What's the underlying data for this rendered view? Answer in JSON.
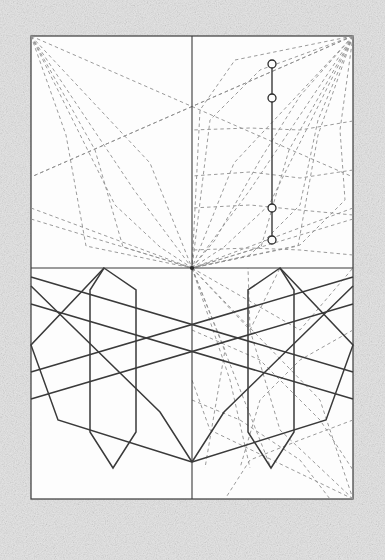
{
  "document": {
    "title": "Geometric construction plate",
    "background_color": "#e2e2e2",
    "paper_color": "#fdfdfd",
    "ink_color": "#3a3a3a",
    "dashed_color": "#8a8a8a",
    "frame": {
      "x": 31,
      "y": 36,
      "width": 322,
      "height": 463
    }
  },
  "chart_data": {
    "type": "diagram",
    "axes": {
      "vertical_axis": {
        "x": 192,
        "y1": 36,
        "y2": 499
      },
      "horizontal_axis": {
        "y": 268,
        "x1": 31,
        "x2": 353
      },
      "center_point": {
        "x": 192,
        "y": 268
      }
    },
    "node_line": {
      "x": 272,
      "y_top": 64,
      "y_bottom": 240,
      "nodes": [
        {
          "cx": 272,
          "cy": 64,
          "r": 4
        },
        {
          "cx": 272,
          "cy": 98,
          "r": 4
        },
        {
          "cx": 272,
          "cy": 208,
          "r": 4
        },
        {
          "cx": 272,
          "cy": 240,
          "r": 4
        }
      ]
    },
    "upper_left_fan": {
      "origin": [
        31,
        36
      ],
      "target": [
        192,
        268
      ],
      "polylines": [
        [
          [
            31,
            36
          ],
          [
            353,
            177
          ]
        ],
        [
          [
            31,
            36
          ],
          [
            150,
            163
          ],
          [
            192,
            268
          ]
        ],
        [
          [
            31,
            36
          ],
          [
            134,
            190
          ],
          [
            192,
            268
          ]
        ],
        [
          [
            31,
            36
          ],
          [
            115,
            205
          ],
          [
            160,
            247
          ],
          [
            192,
            268
          ]
        ],
        [
          [
            31,
            36
          ],
          [
            95,
            150
          ],
          [
            123,
            247
          ],
          [
            192,
            268
          ]
        ],
        [
          [
            31,
            36
          ],
          [
            66,
            135
          ],
          [
            86,
            246
          ],
          [
            192,
            268
          ]
        ],
        [
          [
            31,
            219
          ],
          [
            192,
            268
          ]
        ],
        [
          [
            31,
            208
          ],
          [
            192,
            268
          ]
        ]
      ]
    },
    "upper_right_fan": {
      "origin": [
        353,
        36
      ],
      "target": [
        192,
        268
      ],
      "polylines": [
        [
          [
            353,
            36
          ],
          [
            31,
            177
          ]
        ],
        [
          [
            353,
            36
          ],
          [
            300,
            96
          ],
          [
            260,
            160
          ],
          [
            215,
            240
          ],
          [
            192,
            268
          ]
        ],
        [
          [
            353,
            36
          ],
          [
            318,
            120
          ],
          [
            300,
            205
          ],
          [
            250,
            255
          ],
          [
            192,
            268
          ]
        ],
        [
          [
            353,
            36
          ],
          [
            340,
            130
          ],
          [
            345,
            200
          ],
          [
            300,
            245
          ],
          [
            192,
            268
          ]
        ],
        [
          [
            353,
            36
          ],
          [
            260,
            70
          ],
          [
            210,
            120
          ],
          [
            192,
            268
          ]
        ],
        [
          [
            353,
            36
          ],
          [
            235,
            60
          ],
          [
            200,
            110
          ],
          [
            192,
            268
          ]
        ],
        [
          [
            353,
            121
          ],
          [
            300,
            130
          ],
          [
            250,
            128
          ],
          [
            192,
            130
          ]
        ],
        [
          [
            353,
            170
          ],
          [
            300,
            178
          ],
          [
            250,
            172
          ],
          [
            192,
            176
          ]
        ],
        [
          [
            353,
            215
          ],
          [
            300,
            210
          ],
          [
            250,
            205
          ],
          [
            192,
            208
          ]
        ],
        [
          [
            353,
            255
          ],
          [
            300,
            250
          ],
          [
            250,
            248
          ],
          [
            192,
            250
          ]
        ]
      ]
    },
    "lower_left_figure": {
      "mirror_axis_x": 192,
      "polygon": [
        [
          104,
          268
        ],
        [
          136,
          290
        ],
        [
          136,
          432
        ],
        [
          113,
          468
        ],
        [
          90,
          432
        ],
        [
          90,
          290
        ]
      ],
      "diagonals": [
        [
          [
            31,
            304
          ],
          [
            353,
            399
          ]
        ],
        [
          [
            31,
            372
          ],
          [
            353,
            277
          ]
        ],
        [
          [
            31,
            286
          ],
          [
            160,
            412
          ],
          [
            192,
            462
          ]
        ],
        [
          [
            104,
            268
          ],
          [
            31,
            345
          ],
          [
            58,
            420
          ],
          [
            192,
            462
          ]
        ]
      ]
    },
    "lower_right_figure": {
      "mirror_axis_x": 192,
      "polygon": [
        [
          280,
          268
        ],
        [
          248,
          290
        ],
        [
          248,
          432
        ],
        [
          271,
          468
        ],
        [
          294,
          432
        ],
        [
          294,
          290
        ]
      ]
    },
    "lower_dashed": {
      "polylines": [
        [
          [
            192,
            268
          ],
          [
            250,
            330
          ],
          [
            280,
            268
          ]
        ],
        [
          [
            192,
            268
          ],
          [
            230,
            380
          ],
          [
            250,
            468
          ]
        ],
        [
          [
            192,
            268
          ],
          [
            300,
            330
          ],
          [
            353,
            268
          ]
        ],
        [
          [
            192,
            268
          ],
          [
            320,
            400
          ],
          [
            353,
            499
          ]
        ],
        [
          [
            192,
            268
          ],
          [
            271,
            468
          ]
        ],
        [
          [
            192,
            268
          ],
          [
            225,
            350
          ],
          [
            205,
            468
          ]
        ],
        [
          [
            353,
            499
          ],
          [
            280,
            430
          ],
          [
            250,
            330
          ],
          [
            248,
            268
          ]
        ],
        [
          [
            353,
            499
          ],
          [
            210,
            430
          ],
          [
            192,
            380
          ]
        ],
        [
          [
            353,
            330
          ],
          [
            300,
            360
          ],
          [
            260,
            400
          ],
          [
            240,
            468
          ]
        ],
        [
          [
            353,
            420
          ],
          [
            300,
            440
          ],
          [
            250,
            460
          ],
          [
            225,
            499
          ]
        ],
        [
          [
            192,
            330
          ],
          [
            260,
            360
          ],
          [
            320,
            420
          ],
          [
            353,
            470
          ]
        ],
        [
          [
            192,
            400
          ],
          [
            240,
            420
          ],
          [
            300,
            460
          ],
          [
            330,
            499
          ]
        ]
      ]
    }
  },
  "legend": {
    "solid_label": "solid construction line",
    "dashed_label": "dashed projection line",
    "node_label": "node"
  }
}
